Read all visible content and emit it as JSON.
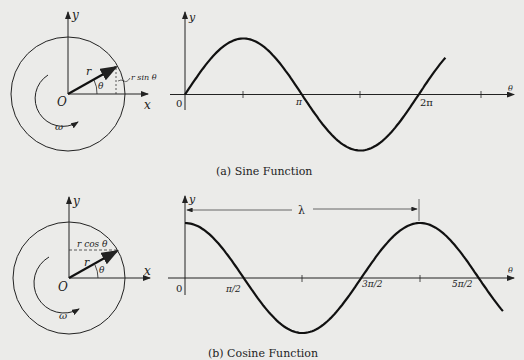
{
  "top": {
    "circle": {
      "y_label": "y",
      "x_label": "x",
      "origin_label": "O",
      "radius_label": "r",
      "angle_label": "θ",
      "omega_label": "ω",
      "projection_label": "r sin θ"
    },
    "plot": {
      "y_label": "y",
      "x_label": "θ",
      "ticks": [
        "0",
        "π",
        "2π"
      ]
    },
    "caption": "(a)  Sine Function"
  },
  "bottom": {
    "circle": {
      "y_label": "y",
      "x_label": "x",
      "origin_label": "O",
      "radius_label": "r",
      "angle_label": "θ",
      "omega_label": "ω",
      "projection_label": "r cos θ"
    },
    "plot": {
      "y_label": "y",
      "x_label": "θ",
      "ticks": [
        "0",
        "π/2",
        "3π/2",
        "5π/2"
      ],
      "wavelength_label": "λ"
    },
    "caption": "(b)  Cosine Function"
  },
  "chart_data": [
    {
      "type": "line",
      "title": "(a) Sine Function",
      "xlabel": "θ",
      "ylabel": "y",
      "x_tick_labels": [
        "0",
        "π",
        "2π"
      ],
      "x_range": [
        0,
        7.0
      ],
      "series": [
        {
          "name": "y = r sin θ",
          "function": "sin",
          "amplitude": 1
        }
      ]
    },
    {
      "type": "line",
      "title": "(b) Cosine Function",
      "xlabel": "θ",
      "ylabel": "y",
      "x_tick_labels": [
        "0",
        "π/2",
        "3π/2",
        "5π/2"
      ],
      "x_range": [
        0,
        8.5
      ],
      "annotations": [
        {
          "label": "λ",
          "from": 0,
          "to": "2π"
        }
      ],
      "series": [
        {
          "name": "y = r cos θ",
          "function": "cos",
          "amplitude": 1
        }
      ]
    }
  ]
}
